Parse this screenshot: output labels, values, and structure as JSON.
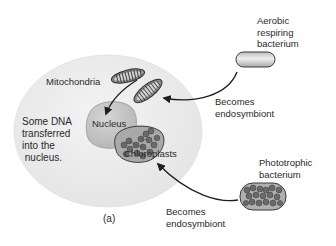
{
  "figure": {
    "panel_label": "(a)",
    "host_cell": {
      "note": "Some DNA\ntransferred\ninto the\n nucleus.",
      "nucleus_label": "Nucleus",
      "mitochondria_label": "Mitochondria",
      "chloroplasts_label": "Chloroplasts"
    },
    "aerobic_bacterium": {
      "label": "Aerobic\nrespiring\nbacterium",
      "arrow_label": "Becomes\nendosymbiont"
    },
    "phototrophic_bacterium": {
      "label": "Phototrophic\nbacterium",
      "arrow_label": "Becomes\nendosymbiont"
    },
    "colors": {
      "background": "#ffffff",
      "host_cell_fill": "#ececec",
      "nucleus_fill": "#c9c9c9",
      "organelle_fill": "#9a9a9a",
      "granule_fill": "#6a6a6a",
      "outline": "#3a3a3a",
      "text": "#2a2a2a"
    }
  }
}
